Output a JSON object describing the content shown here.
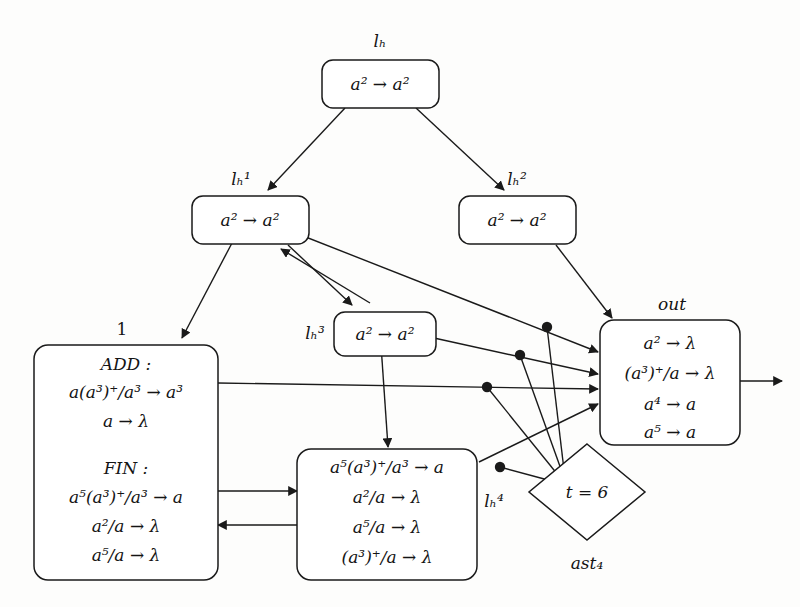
{
  "diagram": {
    "title": "",
    "colors": {
      "stroke": "#1a1a1a",
      "background": "#fdfdfc",
      "text": "#141414"
    },
    "nodes": {
      "lh": {
        "label": "lₕ",
        "label_plain": "lh",
        "rules": [
          "a² → a²"
        ]
      },
      "lh1": {
        "label": "lₕ¹",
        "label_plain": "lh1",
        "rules": [
          "a² → a²"
        ]
      },
      "lh2": {
        "label": "lₕ²",
        "label_plain": "lh2",
        "rules": [
          "a² → a²"
        ]
      },
      "lh3": {
        "label": "lₕ³",
        "label_plain": "lh3",
        "rules": [
          "a² → a²"
        ]
      },
      "lh4": {
        "label": "lₕ⁴",
        "label_plain": "lh4",
        "rules": [
          "a⁵(a³)⁺/a³ → a",
          "a²/a → λ",
          "a⁵/a → λ",
          "(a³)⁺/a → λ"
        ]
      },
      "module1": {
        "label": "1",
        "sections": [
          {
            "heading": "ADD :",
            "rules": [
              "a(a³)⁺/a³ → a³",
              "a → λ"
            ]
          },
          {
            "heading": "FIN :",
            "rules": [
              "a⁵(a³)⁺/a³ → a",
              "a²/a → λ",
              "a⁵/a → λ"
            ]
          }
        ]
      },
      "out": {
        "label": "out",
        "rules": [
          "a² → λ",
          "(a³)⁺/a → λ",
          "a⁴ → a",
          "a⁵ → a"
        ]
      },
      "ast4": {
        "label": "ast₄",
        "label_plain": "ast4",
        "condition": "t = 6"
      }
    },
    "edges": [
      {
        "from": "lh",
        "to": "lh1",
        "kind": "arrow"
      },
      {
        "from": "lh",
        "to": "lh2",
        "kind": "arrow"
      },
      {
        "from": "lh1",
        "to": "module1",
        "kind": "arrow"
      },
      {
        "from": "lh1",
        "to": "lh3",
        "kind": "arrow"
      },
      {
        "from": "lh3",
        "to": "lh1",
        "kind": "arrow"
      },
      {
        "from": "lh1",
        "to": "out",
        "kind": "arrow"
      },
      {
        "from": "lh2",
        "to": "out",
        "kind": "arrow"
      },
      {
        "from": "lh3",
        "to": "lh4",
        "kind": "arrow"
      },
      {
        "from": "lh3",
        "to": "out",
        "kind": "arrow"
      },
      {
        "from": "module1",
        "to": "out",
        "kind": "arrow"
      },
      {
        "from": "module1",
        "to": "lh4",
        "kind": "arrow"
      },
      {
        "from": "lh4",
        "to": "module1",
        "kind": "arrow"
      },
      {
        "from": "lh4",
        "to": "out",
        "kind": "arrow"
      },
      {
        "from": "out",
        "to": "environment",
        "kind": "arrow"
      },
      {
        "from": "ast4",
        "to": "edge-dot-1",
        "kind": "line"
      },
      {
        "from": "ast4",
        "to": "edge-dot-2",
        "kind": "line"
      },
      {
        "from": "ast4",
        "to": "edge-dot-3",
        "kind": "line"
      },
      {
        "from": "ast4",
        "to": "edge-dot-4",
        "kind": "line"
      }
    ]
  }
}
